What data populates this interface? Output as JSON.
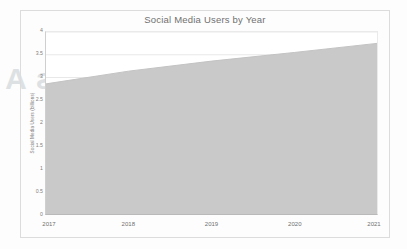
{
  "chart_data": {
    "type": "area",
    "title": "Social Media Users by Year",
    "xlabel": "",
    "ylabel": "Social Media Users (billions)",
    "categories": [
      "2017",
      "2018",
      "2019",
      "2020",
      "2021"
    ],
    "x": [
      2017,
      2018,
      2019,
      2020,
      2021
    ],
    "values": [
      2.86,
      3.14,
      3.36,
      3.55,
      3.75
    ],
    "series": [
      {
        "name": "Social Media Users",
        "values": [
          2.86,
          3.14,
          3.36,
          3.55,
          3.75
        ]
      }
    ],
    "xlim": [
      2017,
      2021
    ],
    "ylim": [
      0,
      4
    ],
    "y_ticks": [
      0,
      0.5,
      1,
      1.5,
      2,
      2.5,
      3,
      3.5,
      4
    ],
    "y_tick_labels": [
      "0",
      "0.5",
      "1",
      "1.5",
      "2",
      "2.5",
      "3",
      "3.5",
      "4"
    ],
    "x_ticks": [
      2017,
      2018,
      2019,
      2020,
      2021
    ],
    "x_tick_labels": [
      "2017",
      "2018",
      "2019",
      "2020",
      "2021"
    ],
    "grid": true,
    "grid_axis": "y",
    "legend": false,
    "legend_position": "none",
    "area_fill_color": "#c9c9c9",
    "area_line_color": "#c2c2c2",
    "plot_background_color": "#ffffff",
    "figure_background_color": "#fdfdfd",
    "grid_color": "#e2e2e2",
    "axis_color": "#b9b9b9",
    "text_color": "#707070",
    "annotations": []
  },
  "figure": {
    "frame_visible": true,
    "frame_color": "#dcdcdc"
  },
  "background_artifacts": {
    "bleed_text_line_1": "Applications A",
    "bleed_text_line_2": "ne"
  }
}
